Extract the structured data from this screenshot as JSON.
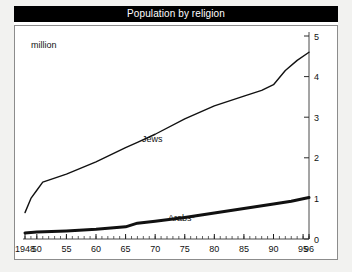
{
  "chart": {
    "title": "Population by religion",
    "unit_label": "million"
  },
  "chart_data": {
    "type": "line",
    "title": "Population by religion",
    "subtitle": "",
    "xlabel": "",
    "ylabel": "million",
    "unit": "million",
    "grid": false,
    "legend": "inline-labels",
    "y_axis_position": "right",
    "xlim": [
      1948,
      1996
    ],
    "ylim": [
      0,
      5
    ],
    "yticks": [
      0,
      1,
      2,
      3,
      4,
      5
    ],
    "ytick_labels": [
      "0",
      "1",
      "2",
      "3",
      "4",
      "5"
    ],
    "xticks": [
      1948,
      1950,
      1955,
      1960,
      1965,
      1970,
      1975,
      1980,
      1985,
      1990,
      1995,
      1996
    ],
    "xtick_labels": [
      "1948",
      "50",
      "55",
      "60",
      "65",
      "70",
      "75",
      "80",
      "85",
      "90",
      "95",
      "96"
    ],
    "minor_xticks": "annual",
    "series": [
      {
        "name": "Jews",
        "style": "thin-line",
        "x": [
          1948,
          1949,
          1950,
          1951,
          1952,
          1955,
          1960,
          1965,
          1967,
          1970,
          1975,
          1980,
          1985,
          1988,
          1990,
          1992,
          1994,
          1996
        ],
        "values": [
          0.65,
          1.0,
          1.2,
          1.4,
          1.45,
          1.6,
          1.9,
          2.25,
          2.38,
          2.58,
          2.96,
          3.28,
          3.52,
          3.66,
          3.8,
          4.15,
          4.4,
          4.6
        ]
      },
      {
        "name": "Arabs*",
        "style": "thick-line",
        "x": [
          1948,
          1950,
          1955,
          1960,
          1965,
          1967,
          1970,
          1975,
          1980,
          1985,
          1990,
          1993,
          1996
        ],
        "values": [
          0.15,
          0.17,
          0.2,
          0.24,
          0.3,
          0.39,
          0.44,
          0.53,
          0.64,
          0.75,
          0.86,
          0.93,
          1.02
        ]
      }
    ],
    "annotations": [
      {
        "text": "Jews",
        "x": 1967,
        "y": 2.35
      },
      {
        "text": "Arabs*",
        "x": 1972,
        "y": 0.63
      }
    ]
  }
}
